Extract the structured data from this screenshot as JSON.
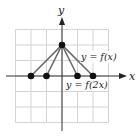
{
  "chart_data": {
    "type": "line",
    "title": "",
    "xlabel": "x",
    "ylabel": "y",
    "grid": true,
    "xlim": [
      -3,
      3
    ],
    "ylim": [
      -3,
      3
    ],
    "series": [
      {
        "name": "y = f(x)",
        "points": [
          [
            -2,
            0
          ],
          [
            0,
            2
          ],
          [
            2,
            0
          ]
        ]
      },
      {
        "name": "y = f(2x)",
        "points": [
          [
            -1,
            0
          ],
          [
            0,
            2
          ],
          [
            1,
            0
          ]
        ]
      }
    ],
    "annotations": [
      "y = f(x)",
      "y = f(2x)"
    ]
  },
  "labels": {
    "x_axis": "x",
    "y_axis": "y",
    "curve1": "y = f(x)",
    "curve2": "y = f(2x)"
  },
  "colors": {
    "grid": "#d4d4d4",
    "axis": "#333333",
    "line": "#6b6b6b",
    "point": "#111111"
  }
}
